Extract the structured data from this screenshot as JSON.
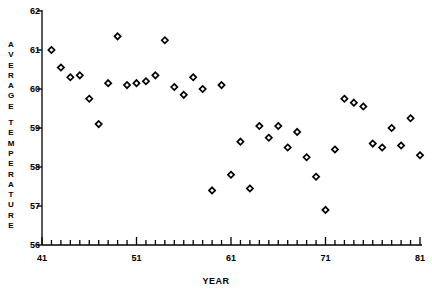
{
  "chart_data": {
    "type": "scatter",
    "title": "",
    "xlabel": "YEAR",
    "ylabel": "AVERAGE TEMPERATURE",
    "ylabel_letters": [
      "A",
      "V",
      "E",
      "R",
      "A",
      "G",
      "E",
      "",
      "T",
      "E",
      "M",
      "P",
      "E",
      "R",
      "A",
      "T",
      "U",
      "R",
      "E"
    ],
    "xlim": [
      41,
      81
    ],
    "ylim": [
      56,
      62
    ],
    "xticks": [
      41,
      51,
      61,
      71,
      81
    ],
    "xticklabels": [
      "41",
      "51",
      "61",
      "71",
      "81"
    ],
    "x_minor_tick_interval": 1,
    "yticks": [
      56,
      57,
      58,
      59,
      60,
      61,
      62
    ],
    "yticklabels": [
      "56",
      "57",
      "58",
      "59",
      "60",
      "61",
      "62"
    ],
    "grid": false,
    "legend": null,
    "marker": "diamond",
    "marker_color": "#000000",
    "x": [
      42,
      43,
      44,
      45,
      46,
      47,
      48,
      49,
      50,
      51,
      52,
      53,
      54,
      55,
      56,
      57,
      58,
      59,
      60,
      61,
      62,
      63,
      64,
      65,
      66,
      67,
      68,
      69,
      70,
      71,
      72,
      73,
      74,
      75,
      76,
      77,
      78,
      79,
      80,
      81
    ],
    "y": [
      61.0,
      60.55,
      60.3,
      60.35,
      59.75,
      59.1,
      60.15,
      61.35,
      60.1,
      60.15,
      60.2,
      60.35,
      61.25,
      60.05,
      59.85,
      60.3,
      60.0,
      57.4,
      60.1,
      57.8,
      58.65,
      57.45,
      59.05,
      58.75,
      59.05,
      58.5,
      58.9,
      58.25,
      57.75,
      56.9,
      58.45,
      59.75,
      59.65,
      59.55,
      58.6,
      58.5,
      59.0,
      58.55,
      59.25,
      58.3
    ],
    "points": [
      {
        "year": 42,
        "temp": 61.0
      },
      {
        "year": 43,
        "temp": 60.55
      },
      {
        "year": 44,
        "temp": 60.3
      },
      {
        "year": 45,
        "temp": 60.35
      },
      {
        "year": 46,
        "temp": 59.75
      },
      {
        "year": 47,
        "temp": 59.1
      },
      {
        "year": 48,
        "temp": 60.15
      },
      {
        "year": 49,
        "temp": 61.35
      },
      {
        "year": 50,
        "temp": 60.1
      },
      {
        "year": 51,
        "temp": 60.15
      },
      {
        "year": 52,
        "temp": 60.2
      },
      {
        "year": 53,
        "temp": 60.35
      },
      {
        "year": 54,
        "temp": 61.25
      },
      {
        "year": 55,
        "temp": 60.05
      },
      {
        "year": 56,
        "temp": 59.85
      },
      {
        "year": 57,
        "temp": 60.3
      },
      {
        "year": 58,
        "temp": 60.0
      },
      {
        "year": 59,
        "temp": 57.4
      },
      {
        "year": 60,
        "temp": 60.1
      },
      {
        "year": 61,
        "temp": 57.8
      },
      {
        "year": 62,
        "temp": 58.65
      },
      {
        "year": 63,
        "temp": 57.45
      },
      {
        "year": 64,
        "temp": 59.05
      },
      {
        "year": 65,
        "temp": 58.75
      },
      {
        "year": 66,
        "temp": 59.05
      },
      {
        "year": 67,
        "temp": 58.5
      },
      {
        "year": 68,
        "temp": 58.9
      },
      {
        "year": 69,
        "temp": 58.25
      },
      {
        "year": 70,
        "temp": 57.75
      },
      {
        "year": 71,
        "temp": 56.9
      },
      {
        "year": 72,
        "temp": 58.45
      },
      {
        "year": 73,
        "temp": 59.75
      },
      {
        "year": 74,
        "temp": 59.65
      },
      {
        "year": 75,
        "temp": 59.55
      },
      {
        "year": 76,
        "temp": 58.6
      },
      {
        "year": 77,
        "temp": 58.5
      },
      {
        "year": 78,
        "temp": 59.0
      },
      {
        "year": 79,
        "temp": 58.55
      },
      {
        "year": 80,
        "temp": 59.25
      },
      {
        "year": 81,
        "temp": 58.3
      }
    ]
  }
}
